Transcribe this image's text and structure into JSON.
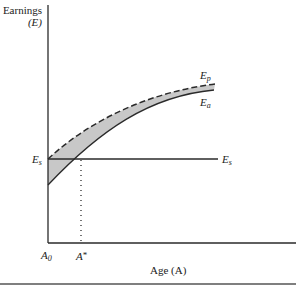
{
  "diagram": {
    "y_axis_label_line1": "Earnings",
    "y_axis_label_line2": "(E)",
    "x_axis_label": "Age (A)",
    "curves": [
      {
        "name": "E_p",
        "label_base": "E",
        "label_sub": "p",
        "style": "dashed",
        "description": "potential earnings"
      },
      {
        "name": "E_a",
        "label_base": "E",
        "label_sub": "a",
        "style": "solid",
        "description": "actual earnings"
      },
      {
        "name": "E_s",
        "label_base": "E",
        "label_sub": "s",
        "style": "solid horizontal"
      }
    ],
    "x_ticks": [
      {
        "base": "A",
        "sub": "0"
      },
      {
        "base": "A",
        "sup": "*"
      }
    ],
    "y_ticks": [
      {
        "base": "E",
        "sub": "s"
      }
    ],
    "shaded_region": "area between E_p and E_a",
    "colors": {
      "axis": "#2a2a2a",
      "shade": "#c8c8c8",
      "rule": "#555555"
    }
  }
}
